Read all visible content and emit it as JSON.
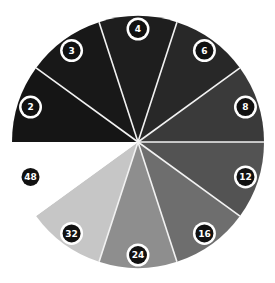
{
  "chart_data": {
    "type": "pie",
    "title": "",
    "start_angle_deg": 180,
    "direction": "clockwise",
    "segments": [
      {
        "label": "2",
        "value": 36,
        "color": "#151515"
      },
      {
        "label": "3",
        "value": 36,
        "color": "#181818"
      },
      {
        "label": "4",
        "value": 36,
        "color": "#1e1e1e"
      },
      {
        "label": "6",
        "value": 36,
        "color": "#282828"
      },
      {
        "label": "8",
        "value": 36,
        "color": "#3a3a3a"
      },
      {
        "label": "12",
        "value": 36,
        "color": "#535353"
      },
      {
        "label": "16",
        "value": 36,
        "color": "#6e6e6e"
      },
      {
        "label": "24",
        "value": 36,
        "color": "#8e8e8e"
      },
      {
        "label": "32",
        "value": 36,
        "color": "#c6c6c6"
      },
      {
        "label": "48",
        "value": 36,
        "color": "#ffffff"
      }
    ],
    "center": [
      138,
      142
    ],
    "radius": 126,
    "divider_color": "#f2f2f2",
    "badge_color": "#111111",
    "badge_text_color": "#ffffff"
  }
}
